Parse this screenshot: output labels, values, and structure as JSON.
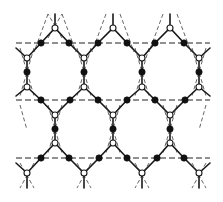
{
  "diagram": {
    "title": "",
    "colors": {
      "background": "#ffffff",
      "solid_line": "#1a1a1a",
      "dashed_horizontal": "#222222",
      "dashed_diagonal": "#555555",
      "filled_node": "#111111",
      "open_node_fill": "#ffffff"
    },
    "dashed_horizontal_rows_y": [
      43,
      100,
      158
    ],
    "filled_nodes": [
      [
        41,
        43
      ],
      [
        69,
        43
      ],
      [
        98,
        43
      ],
      [
        127,
        43
      ],
      [
        155,
        43
      ],
      [
        184,
        43
      ],
      [
        27,
        72
      ],
      [
        84,
        72
      ],
      [
        142,
        72
      ],
      [
        199,
        72
      ],
      [
        41,
        100
      ],
      [
        70,
        100
      ],
      [
        98,
        100
      ],
      [
        127,
        100
      ],
      [
        155,
        100
      ],
      [
        185,
        100
      ],
      [
        55,
        129
      ],
      [
        113,
        129
      ],
      [
        170,
        129
      ],
      [
        41,
        158
      ],
      [
        69,
        158
      ],
      [
        99,
        158
      ],
      [
        127,
        158
      ],
      [
        157,
        158
      ],
      [
        184,
        158
      ]
    ],
    "open_nodes": [
      [
        55,
        28
      ],
      [
        113,
        28
      ],
      [
        170,
        28
      ],
      [
        27,
        58
      ],
      [
        84,
        58
      ],
      [
        142,
        58
      ],
      [
        199,
        58
      ],
      [
        27,
        87
      ],
      [
        84,
        87
      ],
      [
        142,
        87
      ],
      [
        199,
        87
      ],
      [
        55,
        115
      ],
      [
        113,
        115
      ],
      [
        170,
        115
      ],
      [
        55,
        143
      ],
      [
        113,
        143
      ],
      [
        170,
        143
      ],
      [
        27,
        173
      ],
      [
        84,
        173
      ],
      [
        142,
        173
      ],
      [
        199,
        173
      ]
    ]
  }
}
